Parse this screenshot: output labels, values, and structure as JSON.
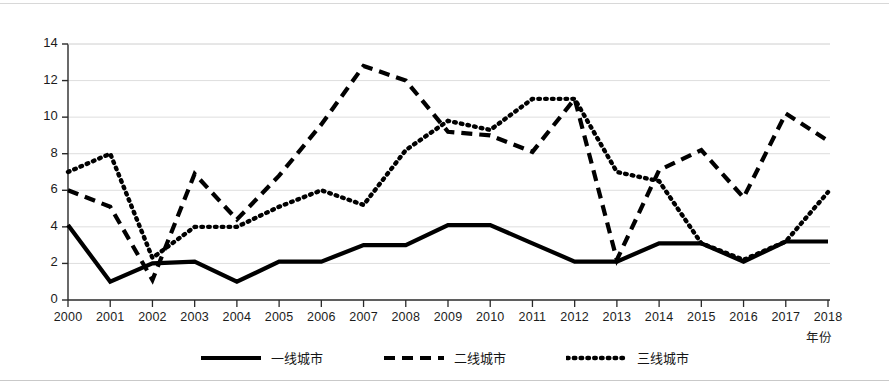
{
  "chart_data": {
    "type": "line",
    "title": "",
    "xlabel": "年份",
    "ylabel": "",
    "xlim": [
      2000,
      2018
    ],
    "ylim": [
      0,
      14
    ],
    "ytick_step": 2,
    "grid": true,
    "legend_position": "bottom",
    "categories": [
      "2000",
      "2001",
      "2002",
      "2003",
      "2004",
      "2005",
      "2006",
      "2007",
      "2008",
      "2009",
      "2010",
      "2011",
      "2012",
      "2013",
      "2014",
      "2015",
      "2016",
      "2017",
      "2018"
    ],
    "series": [
      {
        "name": "一线城市",
        "style": "solid",
        "color": "#000000",
        "values": [
          4.1,
          1.0,
          2.0,
          2.1,
          1.0,
          2.1,
          2.1,
          3.0,
          3.0,
          4.1,
          4.1,
          3.1,
          2.1,
          2.1,
          3.1,
          3.1,
          2.1,
          3.2,
          3.2
        ]
      },
      {
        "name": "二线城市",
        "style": "dashed",
        "color": "#000000",
        "values": [
          6.0,
          5.1,
          1.1,
          6.9,
          4.4,
          6.8,
          9.6,
          12.8,
          12.0,
          9.2,
          9.0,
          8.1,
          11.0,
          2.2,
          7.1,
          8.2,
          5.6,
          10.2,
          8.7
        ]
      },
      {
        "name": "三线城市",
        "style": "dotted",
        "color": "#000000",
        "values": [
          7.0,
          8.0,
          2.3,
          4.0,
          4.0,
          5.1,
          6.0,
          5.2,
          8.2,
          9.8,
          9.3,
          11.0,
          11.0,
          7.0,
          6.5,
          3.1,
          2.2,
          3.2,
          5.9
        ]
      }
    ],
    "ytick_labels": [
      "0",
      "2",
      "4",
      "6",
      "8",
      "10",
      "12",
      "14"
    ]
  },
  "legend": {
    "items": [
      {
        "label": "一线城市",
        "style": "solid"
      },
      {
        "label": "二线城市",
        "style": "dashed"
      },
      {
        "label": "三线城市",
        "style": "dotted"
      }
    ]
  },
  "axis": {
    "x_title": "年份"
  }
}
